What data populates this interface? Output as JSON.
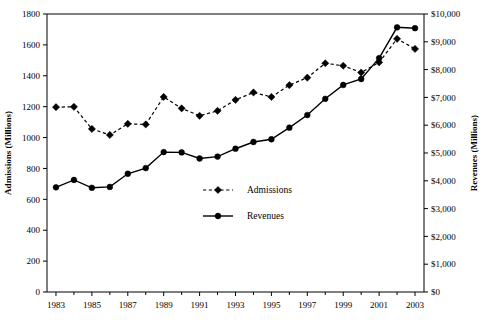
{
  "chart_data": {
    "type": "line",
    "title": "",
    "subtitle": "",
    "xlabel": "",
    "ylabel": "Admissions (Millions)",
    "y2label": "Revenues (Millions)",
    "grid": false,
    "legend_position": "center",
    "x": [
      1983,
      1984,
      1985,
      1986,
      1987,
      1988,
      1989,
      1990,
      1991,
      1992,
      1993,
      1994,
      1995,
      1996,
      1997,
      1998,
      1999,
      2000,
      2001,
      2002,
      2003
    ],
    "xtick_labels": [
      "1983",
      "1985",
      "1987",
      "1989",
      "1991",
      "1993",
      "1995",
      "1997",
      "1999",
      "2001",
      "2003"
    ],
    "xtick_values": [
      1983,
      1985,
      1987,
      1989,
      1991,
      1993,
      1995,
      1997,
      1999,
      2001,
      2003
    ],
    "xlim": [
      1982.5,
      2003.5
    ],
    "ylim": [
      0,
      1800
    ],
    "ytick_labels": [
      "0",
      "200",
      "400",
      "600",
      "800",
      "1000",
      "1200",
      "1400",
      "1600",
      "1800"
    ],
    "ytick_values": [
      0,
      200,
      400,
      600,
      800,
      1000,
      1200,
      1400,
      1600,
      1800
    ],
    "y2lim": [
      0,
      10000
    ],
    "y2tick_labels": [
      "$0",
      "$1,000",
      "$2,000",
      "$3,000",
      "$4,000",
      "$5,000",
      "$6,000",
      "$7,000",
      "$8,000",
      "$9,000",
      "$10,000"
    ],
    "y2tick_values": [
      0,
      1000,
      2000,
      3000,
      4000,
      5000,
      6000,
      7000,
      8000,
      9000,
      10000
    ],
    "series": [
      {
        "name": "Admissions",
        "axis": "left",
        "style": "dashed",
        "marker": "diamond",
        "color": "#000000",
        "values": [
          1197,
          1199,
          1056,
          1017,
          1089,
          1085,
          1263,
          1189,
          1141,
          1173,
          1244,
          1292,
          1263,
          1339,
          1388,
          1481,
          1465,
          1421,
          1487,
          1639,
          1574
        ]
      },
      {
        "name": "Revenues",
        "axis": "right",
        "style": "solid",
        "marker": "circle",
        "color": "#000000",
        "values": [
          3766,
          4031,
          3749,
          3780,
          4253,
          4458,
          5033,
          5022,
          4803,
          4871,
          5154,
          5396,
          5494,
          5912,
          6366,
          6949,
          7448,
          7661,
          8413,
          9520,
          9489
        ]
      }
    ]
  },
  "legend": {
    "items": [
      {
        "label": "Admissions",
        "style": "dashed",
        "marker": "diamond"
      },
      {
        "label": "Revenues",
        "style": "solid",
        "marker": "circle"
      }
    ]
  },
  "axes": {
    "left_title": "Admissions (Millions)",
    "right_title": "Revenues (Millions)"
  }
}
